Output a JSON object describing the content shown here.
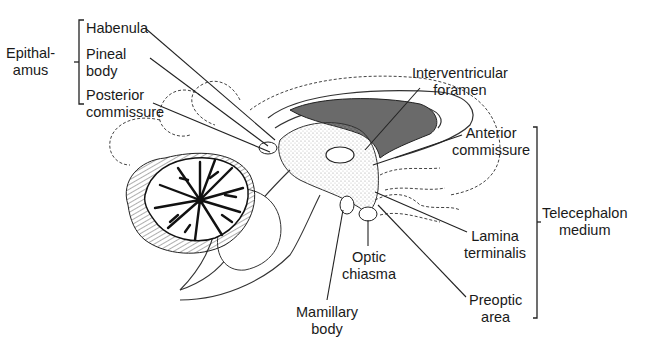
{
  "diagram": {
    "groups": {
      "epithalamus": {
        "label": "Epithal-\namus",
        "members": [
          "Habenula",
          "Pineal body",
          "Posterior commissure"
        ]
      },
      "telencephalon_medium": {
        "label": "Telecephalon\nmedium",
        "members": [
          "Anterior commissure",
          "Lamina terminalis",
          "Preoptic area"
        ]
      }
    },
    "labels": {
      "habenula": "Habenula",
      "pineal_body": "Pineal\nbody",
      "posterior_commissure": "Posterior\ncommissure",
      "interventricular_foramen": "Interventricular\nforamen",
      "anterior_commissure": "Anterior\ncommissure",
      "lamina_terminalis": "Lamina\nterminalis",
      "preoptic_area": "Preoptic\narea",
      "optic_chiasma": "Optic\nchiasma",
      "mamillary_body": "Mamillary\nbody"
    },
    "colors": {
      "ink": "#1a1a1a",
      "ventricle_fill": "#6a6a6a",
      "stipple": "#d8d8d8",
      "background": "#ffffff"
    }
  }
}
